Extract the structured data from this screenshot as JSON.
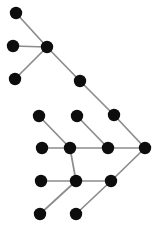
{
  "figure": {
    "kind": "node-link-graph-diagram",
    "title": "",
    "width": 156,
    "height": 231,
    "background_color": "#ffffff"
  },
  "style": {
    "node_fill": "#0d0d0d",
    "node_radius": 6.2,
    "edge_color": "#8c8c8c",
    "edge_width": 1.7
  },
  "chart_data": {
    "type": "scatter",
    "title": "",
    "xlabel": "",
    "ylabel": "",
    "grid": false,
    "legend": "none",
    "xlim": [
      0,
      156
    ],
    "ylim": [
      0,
      231
    ],
    "nodes": [
      {
        "id": "n1",
        "label": "",
        "x": 16,
        "y": 13
      },
      {
        "id": "n2",
        "label": "",
        "x": 13,
        "y": 46
      },
      {
        "id": "n3",
        "label": "",
        "x": 47,
        "y": 47
      },
      {
        "id": "n4",
        "label": "",
        "x": 15,
        "y": 79
      },
      {
        "id": "n5",
        "label": "",
        "x": 80,
        "y": 81
      },
      {
        "id": "n6",
        "label": "",
        "x": 114,
        "y": 115
      },
      {
        "id": "n7",
        "label": "",
        "x": 39,
        "y": 116
      },
      {
        "id": "n8",
        "label": "",
        "x": 77,
        "y": 116
      },
      {
        "id": "n9",
        "label": "",
        "x": 145,
        "y": 148
      },
      {
        "id": "n10",
        "label": "",
        "x": 42,
        "y": 148
      },
      {
        "id": "n11",
        "label": "",
        "x": 70,
        "y": 148
      },
      {
        "id": "n12",
        "label": "",
        "x": 108,
        "y": 148
      },
      {
        "id": "n13",
        "label": "",
        "x": 41,
        "y": 181
      },
      {
        "id": "n14",
        "label": "",
        "x": 76,
        "y": 181
      },
      {
        "id": "n15",
        "label": "",
        "x": 111,
        "y": 181
      },
      {
        "id": "n16",
        "label": "",
        "x": 40,
        "y": 214
      },
      {
        "id": "n17",
        "label": "",
        "x": 76,
        "y": 214
      }
    ],
    "edges": [
      {
        "source": "n1",
        "target": "n3"
      },
      {
        "source": "n2",
        "target": "n3"
      },
      {
        "source": "n4",
        "target": "n3"
      },
      {
        "source": "n3",
        "target": "n5"
      },
      {
        "source": "n5",
        "target": "n6"
      },
      {
        "source": "n6",
        "target": "n9"
      },
      {
        "source": "n7",
        "target": "n11"
      },
      {
        "source": "n8",
        "target": "n12"
      },
      {
        "source": "n10",
        "target": "n11"
      },
      {
        "source": "n11",
        "target": "n12"
      },
      {
        "source": "n12",
        "target": "n9"
      },
      {
        "source": "n11",
        "target": "n14"
      },
      {
        "source": "n13",
        "target": "n14"
      },
      {
        "source": "n14",
        "target": "n15"
      },
      {
        "source": "n15",
        "target": "n9"
      },
      {
        "source": "n16",
        "target": "n14"
      },
      {
        "source": "n17",
        "target": "n15"
      }
    ]
  }
}
